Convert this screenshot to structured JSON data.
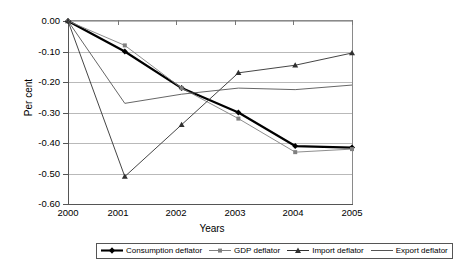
{
  "chart_data": {
    "type": "line",
    "title": "",
    "xlabel": "Years",
    "ylabel": "Per cent",
    "categories": [
      "2000",
      "2001",
      "2002",
      "2003",
      "2004",
      "2005"
    ],
    "x": [
      2000,
      2001,
      2002,
      2003,
      2004,
      2005
    ],
    "ylim": [
      -0.6,
      0.0
    ],
    "ytick_labels": [
      "0.00",
      "-0.10",
      "-0.20",
      "-0.30",
      "-0.40",
      "-0.50",
      "-0.60"
    ],
    "ytick_values": [
      0.0,
      -0.1,
      -0.2,
      -0.3,
      -0.4,
      -0.5,
      -0.6
    ],
    "grid": true,
    "legend_position": "bottom",
    "series": [
      {
        "name": "Consumption deflator",
        "marker": "diamond",
        "line_width": "thick",
        "color": "#000000",
        "values": [
          0.0,
          -0.1,
          -0.22,
          -0.3,
          -0.41,
          -0.415
        ]
      },
      {
        "name": "GDP deflator",
        "marker": "square",
        "line_width": "thin",
        "color": "#808080",
        "values": [
          0.0,
          -0.08,
          -0.22,
          -0.32,
          -0.43,
          -0.42
        ]
      },
      {
        "name": "Import deflator",
        "marker": "triangle",
        "line_width": "thin",
        "color": "#303030",
        "values": [
          0.0,
          -0.51,
          -0.34,
          -0.17,
          -0.145,
          -0.105
        ]
      },
      {
        "name": "Export deflator",
        "marker": "none",
        "line_width": "thin",
        "color": "#555555",
        "values": [
          0.0,
          -0.27,
          -0.24,
          -0.22,
          -0.225,
          -0.21
        ]
      }
    ]
  },
  "axes": {
    "y_title": "Per cent",
    "x_title": "Years"
  },
  "legend": {
    "items": [
      {
        "label": "Consumption deflator",
        "marker": "diamond-thick-line-marker"
      },
      {
        "label": "GDP deflator",
        "marker": "square-thin-line-marker"
      },
      {
        "label": "Import deflator",
        "marker": "triangle-thin-line-marker"
      },
      {
        "label": "Export deflator",
        "marker": "plain-line-marker"
      }
    ]
  }
}
